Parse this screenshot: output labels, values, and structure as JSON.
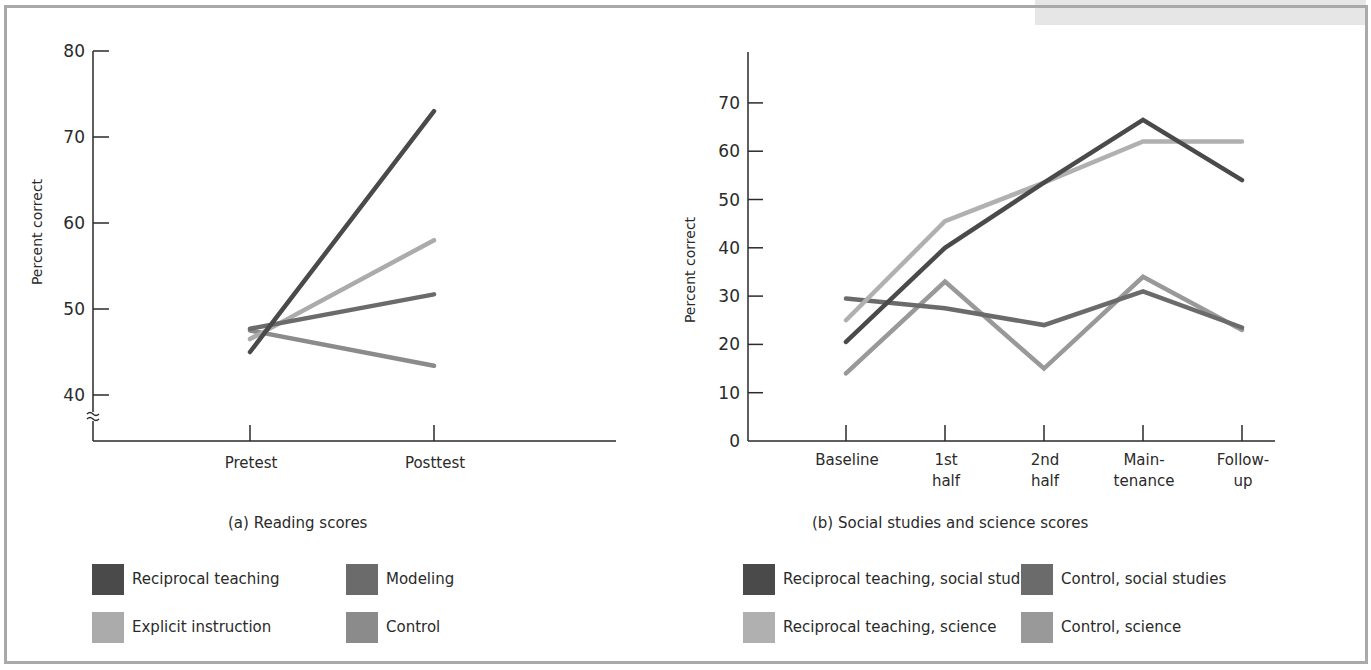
{
  "colors": {
    "reciprocal": "#4a4a4a",
    "modeling": "#6b6b6b",
    "explicit": "#ababab",
    "control": "#8b8b8b",
    "recip_ss": "#4a4a4a",
    "control_ss": "#6b6b6b",
    "recip_sci": "#b0b0b0",
    "control_sci": "#999999"
  },
  "panel_a": {
    "caption": "(a)  Reading scores",
    "ylabel": "Percent correct",
    "yticks": [
      "40",
      "50",
      "60",
      "70",
      "80"
    ],
    "categories": [
      "Pretest",
      "Posttest"
    ],
    "legend": [
      {
        "label": "Reciprocal teaching"
      },
      {
        "label": "Modeling"
      },
      {
        "label": "Explicit instruction"
      },
      {
        "label": "Control"
      }
    ]
  },
  "panel_b": {
    "caption": "(b)  Social studies and science scores",
    "ylabel": "Percent correct",
    "yticks": [
      "0",
      "10",
      "20",
      "30",
      "40",
      "50",
      "60",
      "70"
    ],
    "categories": [
      [
        "Baseline"
      ],
      [
        "1st",
        "half"
      ],
      [
        "2nd",
        "half"
      ],
      [
        "Main-",
        "tenance"
      ],
      [
        "Follow-",
        "up"
      ]
    ],
    "legend": [
      {
        "label": "Reciprocal teaching, social studies"
      },
      {
        "label": "Control, social studies"
      },
      {
        "label": "Reciprocal teaching, science"
      },
      {
        "label": "Control, science"
      }
    ]
  },
  "chart_data": [
    {
      "type": "line",
      "title": "(a) Reading scores",
      "xlabel": "",
      "ylabel": "Percent correct",
      "ylim": [
        40,
        80
      ],
      "axis_break": true,
      "grid": false,
      "legend_position": "bottom",
      "categories": [
        "Pretest",
        "Posttest"
      ],
      "series": [
        {
          "name": "Reciprocal teaching",
          "values": [
            45,
            73
          ]
        },
        {
          "name": "Modeling",
          "values": [
            47.7,
            51.7
          ]
        },
        {
          "name": "Explicit instruction",
          "values": [
            46.5,
            58
          ]
        },
        {
          "name": "Control",
          "values": [
            47.5,
            43.4
          ]
        }
      ]
    },
    {
      "type": "line",
      "title": "(b) Social studies and science scores",
      "xlabel": "",
      "ylabel": "Percent correct",
      "ylim": [
        0,
        78
      ],
      "grid": false,
      "legend_position": "bottom",
      "categories": [
        "Baseline",
        "1st half",
        "2nd half",
        "Maintenance",
        "Follow-up"
      ],
      "series": [
        {
          "name": "Reciprocal teaching, social studies",
          "values": [
            20.5,
            40,
            53.5,
            66.5,
            54
          ]
        },
        {
          "name": "Control, social studies",
          "values": [
            29.5,
            27.5,
            24,
            31,
            23.5
          ]
        },
        {
          "name": "Reciprocal teaching, science",
          "values": [
            25,
            45.5,
            53.5,
            62,
            62
          ]
        },
        {
          "name": "Control, science",
          "values": [
            14,
            33,
            15,
            34,
            23
          ]
        }
      ]
    }
  ]
}
